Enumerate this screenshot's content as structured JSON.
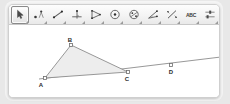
{
  "app": {
    "name": "geometry-applet",
    "background_color": "#ffffff",
    "frame_color": "#cfcfcf"
  },
  "toolbar": {
    "selected_index": 0,
    "tools": [
      {
        "icon": "move-arrow-icon",
        "label": "Move",
        "selected": true
      },
      {
        "icon": "point-icon",
        "label": "Point",
        "selected": false
      },
      {
        "icon": "line-segment-icon",
        "label": "Line",
        "selected": false
      },
      {
        "icon": "perpendicular-line-icon",
        "label": "Perpendicular Line",
        "selected": false
      },
      {
        "icon": "polygon-icon",
        "label": "Polygon",
        "selected": false
      },
      {
        "icon": "circle-center-icon",
        "label": "Circle with Center",
        "selected": false
      },
      {
        "icon": "conic-ellipse-icon",
        "label": "Ellipse",
        "selected": false
      },
      {
        "icon": "angle-measure-icon",
        "label": "Angle",
        "selected": false
      },
      {
        "icon": "reflect-object-icon",
        "label": "Reflect about Line",
        "selected": false
      },
      {
        "icon": "text-abc-icon",
        "label": "Text",
        "selected": false
      },
      {
        "icon": "slider-icon",
        "label": "Slider",
        "selected": false
      },
      {
        "icon": "move-graphics-icon",
        "label": "Move Graphics View",
        "selected": false
      }
    ]
  },
  "figure": {
    "type": "geometry",
    "stroke_color": "#8c8c8c",
    "fill_color": "#ededed",
    "point_color": "#6e6e6e",
    "points": [
      {
        "name": "A",
        "x": 36,
        "y": 53,
        "label_dx": -4,
        "label_dy": 9
      },
      {
        "name": "B",
        "x": 62,
        "y": 20,
        "label_dx": -1,
        "label_dy": -3
      },
      {
        "name": "C",
        "x": 119,
        "y": 47,
        "label_dx": -1,
        "label_dy": 9
      },
      {
        "name": "D",
        "x": 162,
        "y": 40,
        "label_dx": 0,
        "label_dy": 9
      }
    ],
    "polygon": [
      "A",
      "B",
      "C"
    ],
    "line": {
      "through": [
        "A",
        "C",
        "D"
      ],
      "x1": 30,
      "y1": 54,
      "x2": 212,
      "y2": 32
    }
  }
}
